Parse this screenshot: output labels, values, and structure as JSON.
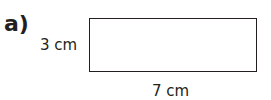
{
  "figure": {
    "part_label": "a)",
    "shape": "rectangle",
    "height_label": "3 cm",
    "width_label": "7 cm",
    "stroke_color": "#231f20"
  }
}
